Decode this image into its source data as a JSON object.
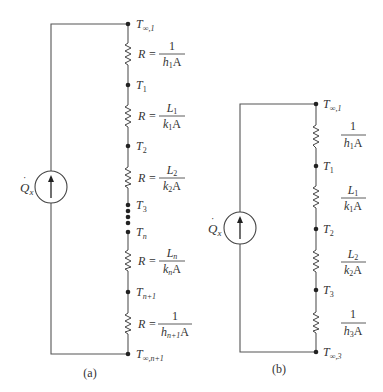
{
  "figure_a": {
    "caption": "(a)",
    "source_label": "Q̇x",
    "nodes": [
      {
        "main": "T",
        "sub": "∞,1"
      },
      {
        "main": "T",
        "sub": "1"
      },
      {
        "main": "T",
        "sub": "2"
      },
      {
        "main": "T",
        "sub": "3"
      },
      {
        "main": "T",
        "sub": "n"
      },
      {
        "main": "T",
        "sub": "n+1"
      },
      {
        "main": "T",
        "sub": "∞,n+1"
      }
    ],
    "resistors": [
      {
        "prefix": "R =",
        "num": "1",
        "den_var": "h",
        "den_sub": "1",
        "den_tail": "A"
      },
      {
        "prefix": "R =",
        "num_var": "L",
        "num_sub": "1",
        "den_var": "k",
        "den_sub": "1",
        "den_tail": "A"
      },
      {
        "prefix": "R =",
        "num_var": "L",
        "num_sub": "2",
        "den_var": "k",
        "den_sub": "2",
        "den_tail": "A"
      },
      {
        "prefix": "R =",
        "num_var": "L",
        "num_sub": "n",
        "den_var": "k",
        "den_sub": "n",
        "den_tail": "A"
      },
      {
        "prefix": "R =",
        "num": "1",
        "den_var": "h",
        "den_sub": "n+1",
        "den_tail": "A"
      }
    ]
  },
  "figure_b": {
    "caption": "(b)",
    "source_label": "Q̇x",
    "nodes": [
      {
        "main": "T",
        "sub": "∞,1"
      },
      {
        "main": "T",
        "sub": "1"
      },
      {
        "main": "T",
        "sub": "2"
      },
      {
        "main": "T",
        "sub": "3"
      },
      {
        "main": "T",
        "sub": "∞,3"
      }
    ],
    "resistors": [
      {
        "num": "1",
        "den_var": "h",
        "den_sub": "1",
        "den_tail": "A"
      },
      {
        "num_var": "L",
        "num_sub": "1",
        "den_var": "k",
        "den_sub": "1",
        "den_tail": "A"
      },
      {
        "num_var": "L",
        "num_sub": "2",
        "den_var": "k",
        "den_sub": "2",
        "den_tail": "A"
      },
      {
        "num": "1",
        "den_var": "h",
        "den_sub": "3",
        "den_tail": "A"
      }
    ]
  },
  "common": {
    "Q": "Q",
    "Q_sub": "x",
    "equals": "R ="
  }
}
